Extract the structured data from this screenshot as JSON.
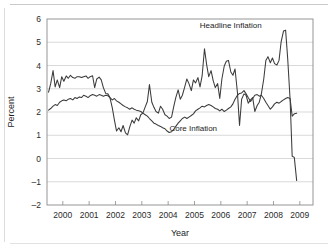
{
  "figure": {
    "background_color": "#ffffff",
    "line_color": "#3b3b3b",
    "grid_color": "#c8c8c8",
    "axis_color": "#8a8a8a"
  },
  "chart_data": {
    "type": "line",
    "title": "",
    "xlabel": "Year",
    "ylabel": "Percent",
    "xlim": [
      1999.4,
      2009.5
    ],
    "ylim": [
      -2,
      6
    ],
    "grid": true,
    "legend_position": "inline-annotations",
    "x_tick_labels": [
      "2000",
      "2001",
      "2002",
      "2003",
      "2004",
      "2005",
      "2006",
      "2007",
      "2008",
      "2009"
    ],
    "x_tick_values": [
      2000,
      2001,
      2002,
      2003,
      2004,
      2005,
      2006,
      2007,
      2008,
      2009
    ],
    "y_tick_labels": [
      "6",
      "5",
      "4",
      "3",
      "2",
      "1",
      "0",
      "-1",
      "-2"
    ],
    "y_tick_values": [
      6,
      5,
      4,
      3,
      2,
      1,
      0,
      -1,
      -2
    ],
    "annotations": [
      {
        "text": "Headline Inflation",
        "x": 2007.55,
        "y": 5.62
      },
      {
        "text": "Core Inflation",
        "x": 2004.05,
        "y": 1.18
      }
    ],
    "series": [
      {
        "name": "Headline Inflation",
        "x": [
          1999.46,
          1999.54,
          1999.63,
          1999.71,
          1999.79,
          1999.88,
          1999.96,
          2000.04,
          2000.13,
          2000.21,
          2000.29,
          2000.38,
          2000.46,
          2000.54,
          2000.63,
          2000.71,
          2000.79,
          2000.88,
          2000.96,
          2001.04,
          2001.13,
          2001.21,
          2001.29,
          2001.38,
          2001.46,
          2001.54,
          2001.63,
          2001.71,
          2001.79,
          2001.88,
          2001.96,
          2002.04,
          2002.13,
          2002.21,
          2002.29,
          2002.38,
          2002.46,
          2002.54,
          2002.63,
          2002.71,
          2002.79,
          2002.88,
          2002.96,
          2003.04,
          2003.13,
          2003.21,
          2003.29,
          2003.38,
          2003.46,
          2003.54,
          2003.63,
          2003.71,
          2003.79,
          2003.88,
          2003.96,
          2004.04,
          2004.13,
          2004.21,
          2004.29,
          2004.38,
          2004.46,
          2004.54,
          2004.63,
          2004.71,
          2004.79,
          2004.88,
          2004.96,
          2005.04,
          2005.13,
          2005.21,
          2005.29,
          2005.38,
          2005.46,
          2005.54,
          2005.63,
          2005.71,
          2005.79,
          2005.88,
          2005.96,
          2006.04,
          2006.13,
          2006.21,
          2006.29,
          2006.38,
          2006.46,
          2006.54,
          2006.63,
          2006.71,
          2006.79,
          2006.88,
          2006.96,
          2007.04,
          2007.13,
          2007.21,
          2007.29,
          2007.38,
          2007.46,
          2007.54,
          2007.63,
          2007.71,
          2007.79,
          2007.88,
          2007.96,
          2008.04,
          2008.13,
          2008.21,
          2008.29,
          2008.38,
          2008.46,
          2008.54,
          2008.63,
          2008.71,
          2008.79,
          2008.88
        ],
        "y": [
          2.85,
          3.22,
          3.78,
          3.08,
          3.38,
          3.05,
          3.52,
          3.32,
          3.55,
          3.45,
          3.58,
          3.48,
          3.45,
          3.52,
          3.52,
          3.48,
          3.52,
          3.55,
          3.45,
          3.52,
          3.56,
          3.05,
          3.42,
          3.5,
          3.38,
          3.05,
          2.8,
          2.78,
          2.62,
          2.18,
          1.65,
          1.18,
          1.32,
          1.15,
          1.42,
          1.1,
          1.02,
          1.35,
          1.65,
          1.52,
          1.75,
          1.62,
          1.88,
          1.95,
          2.22,
          2.45,
          3.18,
          2.42,
          2.2,
          2.02,
          1.95,
          2.25,
          2.12,
          1.88,
          1.82,
          1.72,
          1.78,
          2.22,
          2.62,
          2.95,
          2.55,
          2.72,
          3.08,
          3.42,
          3.22,
          2.92,
          3.38,
          3.25,
          3.48,
          3.08,
          3.55,
          4.72,
          4.05,
          3.52,
          3.78,
          3.35,
          3.05,
          3.22,
          2.58,
          3.42,
          3.98,
          4.18,
          4.22,
          3.72,
          3.58,
          3.85,
          2.85,
          1.42,
          2.55,
          2.78,
          2.72,
          2.38,
          2.52,
          2.62,
          2.02,
          2.28,
          2.42,
          2.78,
          3.42,
          4.22,
          4.38,
          4.12,
          4.32,
          4.08,
          4.02,
          4.22,
          5.02,
          5.48,
          5.52,
          4.28,
          2.55,
          0.1,
          0.05,
          -0.95
        ]
      },
      {
        "name": "Core Inflation",
        "x": [
          1999.46,
          1999.54,
          1999.63,
          1999.71,
          1999.79,
          1999.88,
          1999.96,
          2000.04,
          2000.13,
          2000.21,
          2000.29,
          2000.38,
          2000.46,
          2000.54,
          2000.63,
          2000.71,
          2000.79,
          2000.88,
          2000.96,
          2001.04,
          2001.13,
          2001.21,
          2001.29,
          2001.38,
          2001.46,
          2001.54,
          2001.63,
          2001.71,
          2001.79,
          2001.88,
          2001.96,
          2002.04,
          2002.13,
          2002.21,
          2002.29,
          2002.38,
          2002.46,
          2002.54,
          2002.63,
          2002.71,
          2002.79,
          2002.88,
          2002.96,
          2003.04,
          2003.13,
          2003.21,
          2003.29,
          2003.38,
          2003.46,
          2003.54,
          2003.63,
          2003.71,
          2003.79,
          2003.88,
          2003.96,
          2004.04,
          2004.13,
          2004.21,
          2004.29,
          2004.38,
          2004.46,
          2004.54,
          2004.63,
          2004.71,
          2004.79,
          2004.88,
          2004.96,
          2005.04,
          2005.13,
          2005.21,
          2005.29,
          2005.38,
          2005.46,
          2005.54,
          2005.63,
          2005.71,
          2005.79,
          2005.88,
          2005.96,
          2006.04,
          2006.13,
          2006.21,
          2006.29,
          2006.38,
          2006.46,
          2006.54,
          2006.63,
          2006.71,
          2006.79,
          2006.88,
          2006.96,
          2007.04,
          2007.13,
          2007.21,
          2007.29,
          2007.38,
          2007.46,
          2007.54,
          2007.63,
          2007.71,
          2007.79,
          2007.88,
          2007.96,
          2008.04,
          2008.13,
          2008.21,
          2008.29,
          2008.38,
          2008.46,
          2008.54,
          2008.63,
          2008.71,
          2008.79,
          2008.88
        ],
        "y": [
          2.08,
          2.15,
          2.25,
          2.32,
          2.28,
          2.42,
          2.48,
          2.52,
          2.48,
          2.55,
          2.58,
          2.52,
          2.62,
          2.58,
          2.65,
          2.62,
          2.72,
          2.68,
          2.62,
          2.7,
          2.75,
          2.72,
          2.68,
          2.75,
          2.72,
          2.68,
          2.72,
          2.7,
          2.62,
          2.52,
          2.58,
          2.48,
          2.42,
          2.35,
          2.28,
          2.22,
          2.18,
          2.12,
          2.18,
          2.12,
          2.08,
          2.05,
          2.02,
          1.95,
          1.88,
          1.82,
          1.72,
          1.62,
          1.52,
          1.48,
          1.42,
          1.38,
          1.32,
          1.28,
          1.18,
          1.12,
          1.15,
          1.25,
          1.38,
          1.52,
          1.62,
          1.72,
          1.78,
          1.72,
          1.78,
          1.85,
          1.92,
          2.05,
          2.12,
          2.18,
          2.25,
          2.22,
          2.28,
          2.32,
          2.28,
          2.22,
          2.15,
          2.12,
          2.05,
          2.12,
          2.02,
          2.08,
          2.15,
          2.22,
          2.35,
          2.55,
          2.72,
          2.8,
          2.82,
          2.92,
          2.78,
          2.62,
          2.45,
          2.58,
          2.72,
          2.75,
          2.68,
          2.72,
          2.58,
          2.42,
          2.28,
          2.12,
          2.22,
          2.35,
          2.42,
          2.38,
          2.45,
          2.52,
          2.58,
          2.62,
          2.58,
          1.82,
          1.92,
          1.95
        ]
      }
    ]
  }
}
